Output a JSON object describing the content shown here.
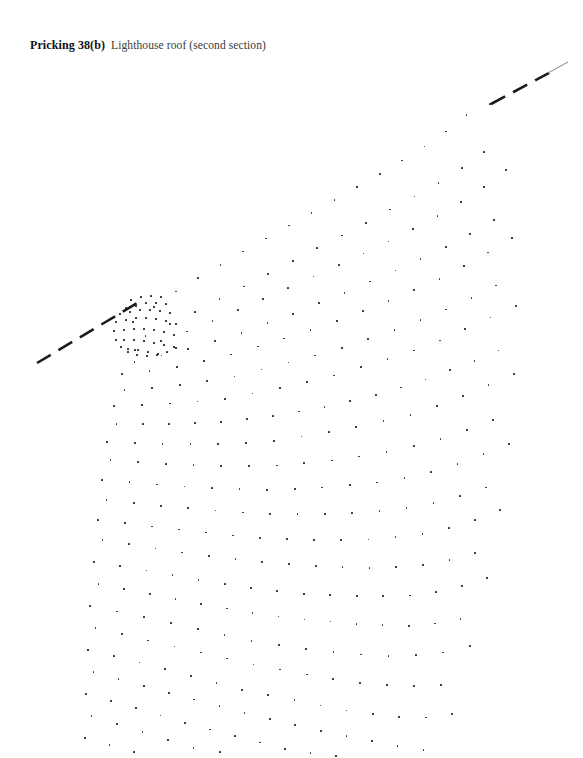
{
  "page": {
    "width": 583,
    "height": 758,
    "background": "#ffffff",
    "ink": "#24242c"
  },
  "caption": {
    "label": "Pricking 38(b)",
    "title": "Lighthouse roof (second section)"
  },
  "chart_data": {
    "type": "scatter",
    "subtitle": "",
    "xlabel": "",
    "ylabel": "",
    "xlim": [
      0,
      583
    ],
    "ylim": [
      758,
      0
    ],
    "grid": false,
    "legend": null,
    "marker": {
      "shape": "dot",
      "size_px": 1.7,
      "color": "#24242c"
    },
    "pivot": {
      "x": 133,
      "y": 322
    },
    "guide_lines": [
      {
        "name": "lower-left-join-line",
        "x1": 37,
        "y1": 363,
        "x2": 139,
        "y2": 302,
        "style": "dashed",
        "dash_pattern": [
          16,
          9
        ],
        "width_px": 2.6,
        "color": "#1b1b1b"
      },
      {
        "name": "upper-right-join-line",
        "x1": 491,
        "y1": 104,
        "x2": 551,
        "y2": 72,
        "style": "dashed",
        "dash_pattern": [
          16,
          9
        ],
        "width_px": 2.6,
        "color": "#1b1b1b"
      },
      {
        "name": "upper-right-join-line-tail",
        "x1": 548,
        "y1": 73,
        "x2": 568,
        "y2": 62,
        "style": "solid",
        "width_px": 1.1,
        "color": "#9a9a9a"
      }
    ],
    "boundaries": {
      "top_edge": [
        [
          133,
          322
        ],
        [
          175,
          288
        ],
        [
          230,
          256
        ],
        [
          290,
          222
        ],
        [
          345,
          192
        ],
        [
          395,
          163
        ],
        [
          440,
          133
        ],
        [
          470,
          110
        ],
        [
          491,
          104
        ]
      ],
      "right_edge": [
        [
          491,
          104
        ],
        [
          510,
          135
        ],
        [
          522,
          175
        ],
        [
          529,
          222
        ],
        [
          531,
          272
        ],
        [
          528,
          330
        ],
        [
          520,
          392
        ],
        [
          508,
          452
        ],
        [
          492,
          512
        ],
        [
          472,
          570
        ],
        [
          450,
          625
        ],
        [
          428,
          672
        ],
        [
          408,
          712
        ],
        [
          392,
          748
        ]
      ],
      "left_edge": [
        [
          133,
          322
        ],
        [
          120,
          360
        ],
        [
          110,
          402
        ],
        [
          103,
          448
        ],
        [
          98,
          498
        ],
        [
          94,
          548
        ],
        [
          91,
          598
        ],
        [
          88,
          648
        ],
        [
          86,
          698
        ],
        [
          85,
          748
        ]
      ],
      "bottom_edge": [
        [
          85,
          748
        ],
        [
          140,
          742
        ],
        [
          200,
          724
        ],
        [
          255,
          700
        ],
        [
          310,
          668
        ],
        [
          360,
          632
        ],
        [
          400,
          592
        ],
        [
          420,
          560
        ]
      ]
    },
    "rows": [
      {
        "name": "row-01-head",
        "points": [
          [
            133,
            322
          ],
          [
            178,
            290
          ],
          [
            232,
            258
          ],
          [
            288,
            226
          ],
          [
            342,
            196
          ],
          [
            392,
            167
          ],
          [
            438,
            138
          ],
          [
            468,
            114
          ],
          [
            490,
            104
          ]
        ]
      },
      {
        "name": "row-02",
        "points": [
          [
            139,
            336
          ],
          [
            188,
            312
          ],
          [
            240,
            285
          ],
          [
            294,
            257
          ],
          [
            348,
            229
          ],
          [
            398,
            202
          ],
          [
            444,
            176
          ],
          [
            478,
            152
          ],
          [
            500,
            136
          ]
        ]
      },
      {
        "name": "row-03",
        "points": [
          [
            135,
            350
          ],
          [
            186,
            332
          ],
          [
            238,
            310
          ],
          [
            292,
            286
          ],
          [
            346,
            262
          ],
          [
            396,
            238
          ],
          [
            442,
            214
          ],
          [
            480,
            190
          ],
          [
            506,
            170
          ]
        ]
      },
      {
        "name": "row-04",
        "points": [
          [
            128,
            362
          ],
          [
            178,
            350
          ],
          [
            232,
            334
          ],
          [
            286,
            314
          ],
          [
            340,
            292
          ],
          [
            390,
            270
          ],
          [
            438,
            248
          ],
          [
            478,
            226
          ],
          [
            510,
            204
          ]
        ]
      },
      {
        "name": "row-05",
        "points": [
          [
            122,
            374
          ],
          [
            172,
            368
          ],
          [
            226,
            356
          ],
          [
            280,
            340
          ],
          [
            334,
            322
          ],
          [
            386,
            302
          ],
          [
            434,
            282
          ],
          [
            476,
            260
          ],
          [
            512,
            238
          ]
        ]
      },
      {
        "name": "row-06",
        "points": [
          [
            118,
            390
          ],
          [
            168,
            386
          ],
          [
            222,
            378
          ],
          [
            276,
            364
          ],
          [
            330,
            350
          ],
          [
            382,
            332
          ],
          [
            430,
            314
          ],
          [
            474,
            294
          ],
          [
            514,
            272
          ]
        ]
      },
      {
        "name": "row-07",
        "points": [
          [
            114,
            406
          ],
          [
            164,
            404
          ],
          [
            218,
            400
          ],
          [
            272,
            390
          ],
          [
            326,
            378
          ],
          [
            378,
            362
          ],
          [
            428,
            346
          ],
          [
            472,
            326
          ],
          [
            516,
            306
          ]
        ]
      },
      {
        "name": "row-08",
        "points": [
          [
            110,
            424
          ],
          [
            160,
            424
          ],
          [
            214,
            422
          ],
          [
            268,
            416
          ],
          [
            322,
            406
          ],
          [
            374,
            394
          ],
          [
            424,
            378
          ],
          [
            470,
            360
          ],
          [
            516,
            340
          ]
        ]
      },
      {
        "name": "row-09",
        "points": [
          [
            107,
            442
          ],
          [
            157,
            444
          ],
          [
            211,
            444
          ],
          [
            265,
            442
          ],
          [
            319,
            434
          ],
          [
            372,
            424
          ],
          [
            422,
            412
          ],
          [
            468,
            394
          ],
          [
            514,
            374
          ]
        ]
      },
      {
        "name": "row-10",
        "points": [
          [
            104,
            460
          ],
          [
            154,
            464
          ],
          [
            208,
            466
          ],
          [
            262,
            466
          ],
          [
            316,
            462
          ],
          [
            369,
            454
          ],
          [
            419,
            444
          ],
          [
            466,
            428
          ],
          [
            512,
            410
          ]
        ]
      },
      {
        "name": "row-11",
        "points": [
          [
            102,
            480
          ],
          [
            152,
            484
          ],
          [
            206,
            488
          ],
          [
            260,
            490
          ],
          [
            314,
            488
          ],
          [
            367,
            484
          ],
          [
            417,
            476
          ],
          [
            464,
            462
          ],
          [
            509,
            444
          ]
        ]
      },
      {
        "name": "row-12",
        "points": [
          [
            100,
            500
          ],
          [
            150,
            506
          ],
          [
            204,
            510
          ],
          [
            258,
            514
          ],
          [
            312,
            514
          ],
          [
            365,
            512
          ],
          [
            415,
            506
          ],
          [
            462,
            494
          ],
          [
            505,
            478
          ]
        ]
      },
      {
        "name": "row-13",
        "points": [
          [
            98,
            520
          ],
          [
            148,
            526
          ],
          [
            202,
            532
          ],
          [
            256,
            538
          ],
          [
            310,
            540
          ],
          [
            363,
            540
          ],
          [
            412,
            536
          ],
          [
            459,
            526
          ],
          [
            500,
            510
          ]
        ]
      },
      {
        "name": "row-14",
        "points": [
          [
            96,
            540
          ],
          [
            146,
            548
          ],
          [
            200,
            556
          ],
          [
            254,
            562
          ],
          [
            308,
            566
          ],
          [
            360,
            568
          ],
          [
            409,
            566
          ],
          [
            455,
            558
          ],
          [
            494,
            544
          ]
        ]
      },
      {
        "name": "row-15",
        "points": [
          [
            94,
            562
          ],
          [
            144,
            570
          ],
          [
            198,
            580
          ],
          [
            252,
            588
          ],
          [
            306,
            594
          ],
          [
            357,
            596
          ],
          [
            405,
            596
          ],
          [
            450,
            590
          ],
          [
            487,
            578
          ]
        ]
      },
      {
        "name": "row-16",
        "points": [
          [
            92,
            584
          ],
          [
            142,
            594
          ],
          [
            196,
            604
          ],
          [
            250,
            614
          ],
          [
            303,
            620
          ],
          [
            354,
            624
          ],
          [
            401,
            626
          ],
          [
            444,
            622
          ],
          [
            479,
            612
          ]
        ]
      },
      {
        "name": "row-17",
        "points": [
          [
            90,
            606
          ],
          [
            140,
            616
          ],
          [
            194,
            628
          ],
          [
            247,
            640
          ],
          [
            300,
            648
          ],
          [
            350,
            654
          ],
          [
            396,
            656
          ],
          [
            437,
            654
          ],
          [
            470,
            646
          ]
        ]
      },
      {
        "name": "row-18",
        "points": [
          [
            89,
            628
          ],
          [
            139,
            640
          ],
          [
            192,
            652
          ],
          [
            245,
            664
          ],
          [
            297,
            674
          ],
          [
            346,
            682
          ],
          [
            390,
            686
          ],
          [
            430,
            686
          ],
          [
            461,
            680
          ]
        ]
      },
      {
        "name": "row-19",
        "points": [
          [
            88,
            650
          ],
          [
            138,
            662
          ],
          [
            191,
            676
          ],
          [
            243,
            690
          ],
          [
            294,
            700
          ],
          [
            342,
            710
          ],
          [
            385,
            716
          ],
          [
            423,
            718
          ],
          [
            452,
            714
          ]
        ]
      },
      {
        "name": "row-20",
        "points": [
          [
            87,
            672
          ],
          [
            137,
            686
          ],
          [
            190,
            700
          ],
          [
            242,
            714
          ],
          [
            292,
            726
          ],
          [
            339,
            736
          ],
          [
            380,
            744
          ],
          [
            416,
            750
          ],
          [
            443,
            750
          ]
        ]
      },
      {
        "name": "row-21",
        "points": [
          [
            86,
            694
          ],
          [
            136,
            708
          ],
          [
            189,
            724
          ],
          [
            241,
            738
          ],
          [
            290,
            750
          ],
          [
            336,
            756
          ]
        ]
      },
      {
        "name": "row-22",
        "points": [
          [
            85,
            716
          ],
          [
            135,
            732
          ],
          [
            188,
            748
          ],
          [
            240,
            756
          ]
        ]
      },
      {
        "name": "row-23",
        "points": [
          [
            85,
            738
          ],
          [
            134,
            752
          ]
        ]
      }
    ],
    "pivot_cluster": {
      "name": "dense-pivot-cluster",
      "description": "Tight nest of closely spaced pin holes where all rows converge at the left corner of the fan.",
      "points": [
        [
          131,
          300
        ],
        [
          141,
          297
        ],
        [
          151,
          296
        ],
        [
          161,
          297
        ],
        [
          146,
          303
        ],
        [
          156,
          303
        ],
        [
          166,
          304
        ],
        [
          136,
          306
        ],
        [
          126,
          308
        ],
        [
          120,
          314
        ],
        [
          116,
          322
        ],
        [
          114,
          331
        ],
        [
          116,
          340
        ],
        [
          121,
          347
        ],
        [
          128,
          352
        ],
        [
          137,
          355
        ],
        [
          147,
          356
        ],
        [
          157,
          355
        ],
        [
          167,
          352
        ],
        [
          176,
          348
        ],
        [
          130,
          312
        ],
        [
          140,
          310
        ],
        [
          150,
          310
        ],
        [
          160,
          311
        ],
        [
          170,
          313
        ],
        [
          126,
          320
        ],
        [
          136,
          318
        ],
        [
          146,
          318
        ],
        [
          156,
          319
        ],
        [
          166,
          321
        ],
        [
          176,
          324
        ],
        [
          124,
          330
        ],
        [
          134,
          329
        ],
        [
          144,
          329
        ],
        [
          154,
          330
        ],
        [
          164,
          332
        ],
        [
          174,
          335
        ],
        [
          124,
          340
        ],
        [
          134,
          340
        ],
        [
          144,
          341
        ],
        [
          154,
          343
        ],
        [
          164,
          345
        ],
        [
          174,
          347
        ],
        [
          128,
          349
        ],
        [
          138,
          350
        ],
        [
          148,
          352
        ],
        [
          158,
          354
        ]
      ]
    }
  }
}
